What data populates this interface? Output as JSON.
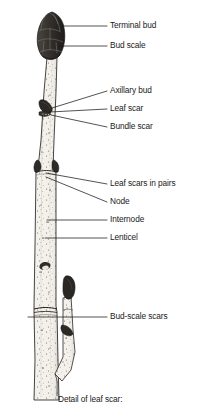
{
  "figure": {
    "title_caption": "Detail of leaf scar:",
    "colors": {
      "ink": "#1a1a1a",
      "bud_dark": "#3a3632",
      "bark_light": "#f2efe9",
      "bark_shade": "#b9b3a8",
      "stipple": "#6b6560",
      "background": "#ffffff"
    }
  },
  "labels": [
    {
      "id": "terminal-bud",
      "text": "Terminal bud",
      "x": 113,
      "y": 22,
      "leader_x1": 107,
      "leader_y1": 26,
      "leader_x2": 62,
      "leader_y2": 26
    },
    {
      "id": "bud-scale",
      "text": "Bud scale",
      "x": 113,
      "y": 42,
      "leader_x1": 107,
      "leader_y1": 46,
      "leader_x2": 60,
      "leader_y2": 46
    },
    {
      "id": "axillary-bud",
      "text": "Axillary bud",
      "x": 113,
      "y": 87,
      "leader_x1": 107,
      "leader_y1": 91,
      "leader_x2": 52,
      "leader_y2": 108
    },
    {
      "id": "leaf-scar",
      "text": "Leaf scar",
      "x": 113,
      "y": 105,
      "leader_x1": 107,
      "leader_y1": 109,
      "leader_x2": 50,
      "leader_y2": 112
    },
    {
      "id": "bundle-scar",
      "text": "Bundle scar",
      "x": 113,
      "y": 123,
      "leader_x1": 107,
      "leader_y1": 127,
      "leader_x2": 50,
      "leader_y2": 115
    },
    {
      "id": "leaf-scars-pairs",
      "text": "Leaf scars in pairs",
      "x": 113,
      "y": 180,
      "leader_x1": 107,
      "leader_y1": 184,
      "leader_x2": 46,
      "leader_y2": 173
    },
    {
      "id": "node",
      "text": "Node",
      "x": 113,
      "y": 198,
      "leader_x1": 107,
      "leader_y1": 202,
      "leader_x2": 46,
      "leader_y2": 177
    },
    {
      "id": "internode",
      "text": "Internode",
      "x": 113,
      "y": 216,
      "leader_x1": 107,
      "leader_y1": 220,
      "leader_x2": 47,
      "leader_y2": 220
    },
    {
      "id": "lenticel",
      "text": "Lenticel",
      "x": 113,
      "y": 234,
      "leader_x1": 107,
      "leader_y1": 238,
      "leader_x2": 45,
      "leader_y2": 238
    },
    {
      "id": "bud-scale-scars",
      "text": "Bud-scale scars",
      "x": 113,
      "y": 313,
      "leader_x1": 107,
      "leader_y1": 317,
      "leader_x2": 28,
      "leader_y2": 317
    }
  ],
  "structures": [
    {
      "id": "terminal-bud-shape",
      "name": "terminal bud",
      "scales": 11
    },
    {
      "id": "axillary-bud-shape",
      "name": "axillary bud"
    },
    {
      "id": "node-bud-left",
      "name": "node bud left"
    },
    {
      "id": "node-bud-right",
      "name": "node bud right"
    },
    {
      "id": "side-branch",
      "name": "lateral branch"
    },
    {
      "id": "branch-tip-bud",
      "name": "branch terminal bud"
    },
    {
      "id": "branch-side-bud",
      "name": "branch lateral bud"
    },
    {
      "id": "bud-scale-scar-ring",
      "name": "bud-scale scar ring"
    }
  ]
}
